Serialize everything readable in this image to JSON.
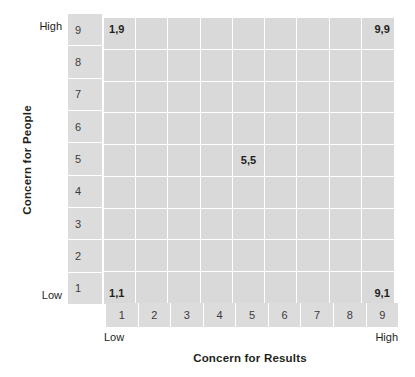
{
  "chart_data": {
    "type": "table",
    "title": "",
    "xlabel": "Concern for Results",
    "ylabel": "Concern for People",
    "x_ticks": [
      "1",
      "2",
      "3",
      "4",
      "5",
      "6",
      "7",
      "8",
      "9"
    ],
    "y_ticks": [
      "9",
      "8",
      "7",
      "6",
      "5",
      "4",
      "3",
      "2",
      "1"
    ],
    "xlim": [
      1,
      9
    ],
    "ylim": [
      1,
      9
    ],
    "x_end_labels": {
      "low": "Low",
      "high": "High"
    },
    "y_end_labels": {
      "low": "Low",
      "high": "High"
    },
    "grid": true,
    "legend": "none",
    "annotations": [
      {
        "label": "1,9",
        "x": 1,
        "y": 9,
        "position": "top-left"
      },
      {
        "label": "9,9",
        "x": 9,
        "y": 9,
        "position": "top-right"
      },
      {
        "label": "5,5",
        "x": 5,
        "y": 5,
        "position": "center"
      },
      {
        "label": "1,1",
        "x": 1,
        "y": 1,
        "position": "bottom-left"
      },
      {
        "label": "9,1",
        "x": 9,
        "y": 1,
        "position": "bottom-right"
      }
    ],
    "colors": {
      "cell_fill": "#d9d9d9",
      "strip_fill": "#dcdcdc",
      "gridline": "#ffffff",
      "text": "#231f20",
      "tick_text": "#3b3b3b",
      "background": "#ffffff"
    }
  },
  "axes": {
    "x_title": "Concern for Results",
    "y_title": "Concern for People",
    "y_high": "High",
    "y_low": "Low",
    "x_low": "Low",
    "x_high": "High"
  },
  "y_ticks": [
    "9",
    "8",
    "7",
    "6",
    "5",
    "4",
    "3",
    "2",
    "1"
  ],
  "x_ticks": [
    "1",
    "2",
    "3",
    "4",
    "5",
    "6",
    "7",
    "8",
    "9"
  ],
  "cell_labels": {
    "top_left": "1,9",
    "top_right": "9,9",
    "center": "5,5",
    "bottom_left": "1,1",
    "bottom_right": "9,1"
  }
}
